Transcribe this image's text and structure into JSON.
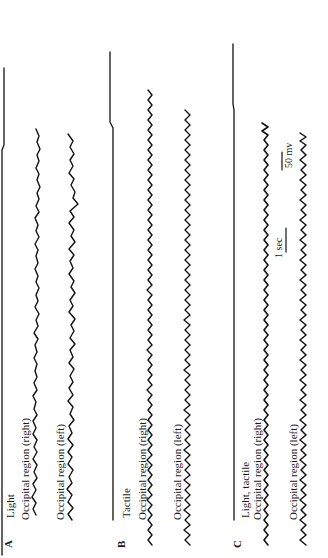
{
  "figure": {
    "orientation": "rotated 90 degrees counter-clockwise",
    "panels": [
      {
        "letter": "A",
        "stimulus": "Light",
        "traces": [
          {
            "label": "Occipital region (right)"
          },
          {
            "label": "Occipital region (left)"
          }
        ]
      },
      {
        "letter": "B",
        "stimulus": "Tactile",
        "traces": [
          {
            "label": "Occipital region (right)"
          },
          {
            "label": "Occipital region (left)"
          }
        ]
      },
      {
        "letter": "C",
        "stimulus": "Light, tactile",
        "traces": [
          {
            "label": "Occipital region (right)"
          },
          {
            "label": "Occipital region (left)"
          }
        ]
      }
    ],
    "scale_bars": {
      "time": "1 sec",
      "amplitude": "50 mv"
    }
  }
}
